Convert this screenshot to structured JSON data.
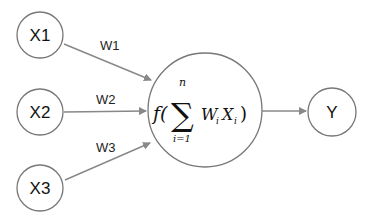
{
  "diagram": {
    "type": "perceptron",
    "colors": {
      "stroke": "#777777",
      "arrow": "#888888",
      "text": "#111111",
      "background": "#ffffff"
    },
    "inputs": [
      {
        "id": "x1",
        "label": "X1",
        "weight": "W1"
      },
      {
        "id": "x2",
        "label": "X2",
        "weight": "W2"
      },
      {
        "id": "x3",
        "label": "X3",
        "weight": "W3"
      }
    ],
    "neuron": {
      "function": "f(",
      "sum_symbol": "∑",
      "upper_limit": "n",
      "lower_limit": "i=1",
      "term_w": "W",
      "term_w_sub": "i",
      "term_x": "X",
      "term_x_sub": "i",
      "close": ")"
    },
    "output": {
      "id": "y",
      "label": "Y"
    }
  }
}
